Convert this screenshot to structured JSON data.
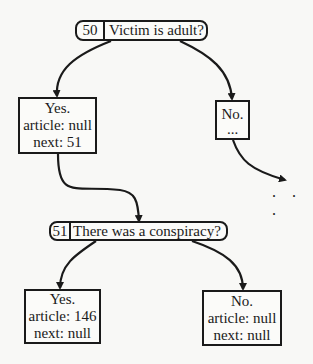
{
  "diagram": {
    "nodes": {
      "q50": {
        "id": "50",
        "question": "Victim is adult?"
      },
      "yes50": {
        "lines": [
          "Yes.",
          "article: null",
          "next: 51"
        ]
      },
      "no50": {
        "lines": [
          "No.",
          "..."
        ]
      },
      "q51": {
        "id": "51",
        "question": "There was a conspiracy?"
      },
      "yes51": {
        "lines": [
          "Yes.",
          "article: 146",
          "next: null"
        ]
      },
      "no51": {
        "lines": [
          "No.",
          "article: null",
          "next: null"
        ]
      }
    },
    "continuation": ". . .",
    "edges": [
      {
        "from": "q50",
        "to": "yes50"
      },
      {
        "from": "q50",
        "to": "no50"
      },
      {
        "from": "no50",
        "to": "continuation"
      },
      {
        "from": "yes50",
        "to": "q51"
      },
      {
        "from": "q51",
        "to": "yes51"
      },
      {
        "from": "q51",
        "to": "no51"
      }
    ],
    "colors": {
      "stroke": "#1a1a1a",
      "background": "#f8f8f6"
    }
  }
}
